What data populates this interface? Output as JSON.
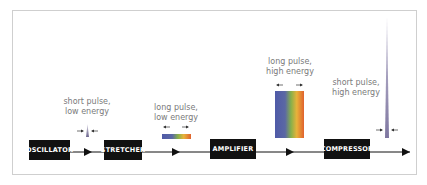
{
  "diagram": {
    "stages": [
      {
        "id": "oscillator",
        "label": "OSCILLATOR"
      },
      {
        "id": "stretcher",
        "label": "STRETCHER"
      },
      {
        "id": "amplifier",
        "label": "AMPLIFIER"
      },
      {
        "id": "compressor",
        "label": "COMPRESSOR"
      }
    ],
    "pulses": [
      {
        "id": "after-oscillator",
        "line1": "short pulse,",
        "line2": "low energy",
        "type": "short-low"
      },
      {
        "id": "after-stretcher",
        "line1": "long pulse,",
        "line2": "low energy",
        "type": "long-low"
      },
      {
        "id": "after-amplifier",
        "line1": "long pulse,",
        "line2": "high energy",
        "type": "long-high"
      },
      {
        "id": "after-compressor",
        "line1": "short pulse,",
        "line2": "high energy",
        "type": "short-high"
      }
    ],
    "colors": {
      "box": "#111111",
      "line": "#111111",
      "label": "#7a7a7a",
      "spike": "#8a82a8",
      "spectrum": [
        "#4f5aa8",
        "#5b62a6",
        "#7ab04a",
        "#e8b23a",
        "#e0622e"
      ]
    }
  }
}
